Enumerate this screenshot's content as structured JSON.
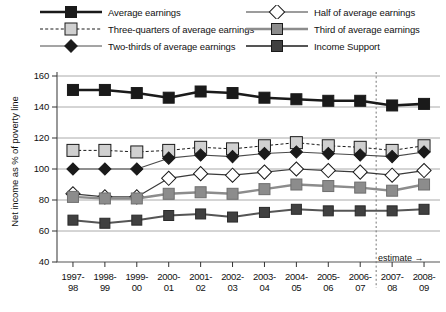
{
  "chart_data": {
    "type": "line",
    "title": "",
    "xlabel": "",
    "ylabel": "Net income as % of poverty line",
    "ylim": [
      40,
      160
    ],
    "yticks": [
      40,
      60,
      80,
      100,
      120,
      140,
      160
    ],
    "grid": true,
    "legend_position": "top",
    "categories": [
      "1997-98",
      "1998-99",
      "1999-00",
      "2000-01",
      "2001-02",
      "2002-03",
      "2003-04",
      "2004-05",
      "2005-06",
      "2006-07",
      "2007-08",
      "2008-09"
    ],
    "annotation": "estimate →",
    "estimate_divider_after_category": "2006-07",
    "series": [
      {
        "name": "Average earnings",
        "marker": "filled-square",
        "color": "#1a1a1a",
        "line_style": "solid",
        "values": [
          151,
          151,
          149,
          146,
          150,
          149,
          146,
          145,
          144,
          144,
          141,
          142
        ]
      },
      {
        "name": "Three-quarters of average earnings",
        "marker": "light-square",
        "color": "#d0d0d0",
        "line_style": "dashed",
        "values": [
          112,
          112,
          111,
          112,
          114,
          113,
          115,
          117,
          115,
          114,
          112,
          115
        ]
      },
      {
        "name": "Two-thirds of average earnings",
        "marker": "filled-diamond",
        "color": "#1a1a1a",
        "line_style": "solid",
        "values": [
          100,
          100,
          100,
          107,
          109,
          108,
          110,
          111,
          110,
          109,
          108,
          111
        ]
      },
      {
        "name": "Half of average earnings",
        "marker": "open-diamond",
        "color": "#ffffff",
        "line_style": "solid",
        "values": [
          84,
          82,
          82,
          94,
          97,
          96,
          98,
          100,
          99,
          98,
          96,
          99
        ]
      },
      {
        "name": "Third of average earnings",
        "marker": "mid-gray-square",
        "color": "#8c8c8c",
        "line_style": "solid",
        "values": [
          82,
          81,
          81,
          84,
          85,
          84,
          87,
          90,
          89,
          88,
          86,
          90
        ]
      },
      {
        "name": "Income Support",
        "marker": "dark-gray-square",
        "color": "#404040",
        "line_style": "solid",
        "values": [
          67,
          65,
          67,
          70,
          71,
          69,
          72,
          74,
          73,
          73,
          73,
          74
        ]
      }
    ]
  },
  "legend": {
    "items": [
      {
        "label": "Average earnings",
        "column": "left",
        "row": 0
      },
      {
        "label": "Three-quarters of average earnings",
        "column": "left",
        "row": 1
      },
      {
        "label": "Two-thirds of average earnings",
        "column": "left",
        "row": 2
      },
      {
        "label": "Half of average earnings",
        "column": "right",
        "row": 0
      },
      {
        "label": "Third of average earnings",
        "column": "right",
        "row": 1
      },
      {
        "label": "Income Support",
        "column": "right",
        "row": 2
      }
    ]
  },
  "colors": {
    "average_earnings": "#1a1a1a",
    "three_quarters": "#d0d0d0",
    "two_thirds": "#1a1a1a",
    "half": "#ffffff",
    "third": "#8c8c8c",
    "income_support": "#404040",
    "gridline": "#aaaaaa",
    "axis": "#555555",
    "text": "#111111"
  }
}
